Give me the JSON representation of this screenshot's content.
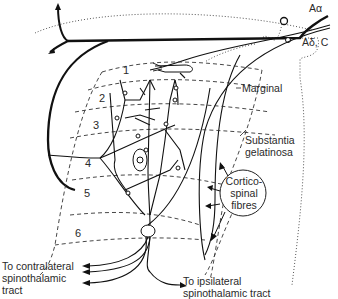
{
  "diagram": {
    "type": "spinal cord dorsal horn laminae with afferent fibres",
    "fibre_labels": {
      "a_alpha": "Aα",
      "a_delta_c": "Aδ, C"
    },
    "laminae": [
      "1",
      "2",
      "3",
      "4",
      "5",
      "6"
    ],
    "region_labels": {
      "marginal": "Marginal",
      "substantia_line1": "Substantia",
      "substantia_line2": "gelatinosa"
    },
    "corticospinal": {
      "line1": "Cortico-",
      "line2": "spinal",
      "line3": "fibres"
    },
    "outputs": {
      "contralateral_line1": "To contralateral",
      "contralateral_line2": "spinothalamic",
      "contralateral_line3": "tract",
      "ipsilateral_line1": "To ipsilateral",
      "ipsilateral_line2": "spinothalamic tract"
    }
  }
}
